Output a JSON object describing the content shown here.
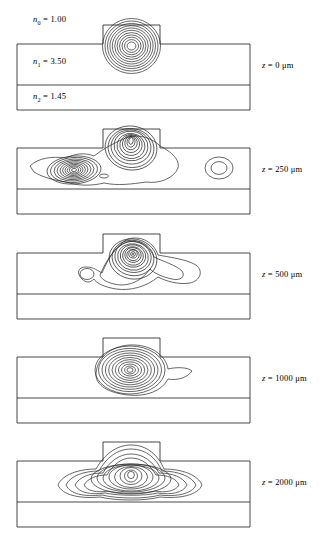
{
  "figure": {
    "type": "contour-propagation-sequence",
    "geometry": {
      "structure_left_px": 17,
      "structure_right_px": 250,
      "slab_top_px": 44,
      "layer_boundary_px": 85,
      "structure_bottom_px": 110,
      "rib_left_px": 103,
      "rib_right_px": 160,
      "rib_top_px": 25
    },
    "index_labels": [
      {
        "name": "n0",
        "symbol": "n",
        "subscript": "0",
        "equals": "=",
        "value": "1.00",
        "text": "n0 = 1.00"
      },
      {
        "name": "n1",
        "symbol": "n",
        "subscript": "1",
        "equals": "=",
        "value": "3.50",
        "text": "n1 = 3.50"
      },
      {
        "name": "n2",
        "symbol": "n",
        "subscript": "2",
        "equals": "=",
        "value": "1.45",
        "text": "n2 = 1.45"
      }
    ],
    "panels": [
      {
        "id": "panel-z0",
        "z_symbol": "z",
        "z_equals": "=",
        "z_value": "0",
        "z_unit": "μm",
        "z_label": "z = 0 μm",
        "contour_description": "single tight circular mode centred on the rib, about 11 concentric rings",
        "contour_count": 11
      },
      {
        "id": "panel-z250",
        "z_symbol": "z",
        "z_equals": "=",
        "z_value": "250",
        "z_unit": "μm",
        "z_label": "z = 250 μm",
        "contour_description": "field split into a left lobe in the slab, a strong lobe under the rib, and a small isolated blob to the right",
        "contour_count": 10
      },
      {
        "id": "panel-z500",
        "z_symbol": "z",
        "z_equals": "=",
        "z_value": "500",
        "z_unit": "μm",
        "z_label": "z = 500 μm",
        "contour_description": "single main lobe under the rib with tails extending left and right along the slab",
        "contour_count": 11
      },
      {
        "id": "panel-z1000",
        "z_symbol": "z",
        "z_equals": "=",
        "z_value": "1000",
        "z_unit": "μm",
        "z_label": "z = 1000 μm",
        "contour_description": "compact oval mode centred beneath the rib with a small right spur",
        "contour_count": 11
      },
      {
        "id": "panel-z2000",
        "z_symbol": "z",
        "z_equals": "=",
        "z_value": "2000",
        "z_unit": "μm",
        "z_label": "z = 2000 μm",
        "contour_description": "settled guided mode, rounded contours spreading symmetrically into the slab",
        "contour_count": 11
      }
    ],
    "colors": {
      "line": "#1a1a1a",
      "contour": "#262626",
      "background": "#ffffff"
    }
  }
}
